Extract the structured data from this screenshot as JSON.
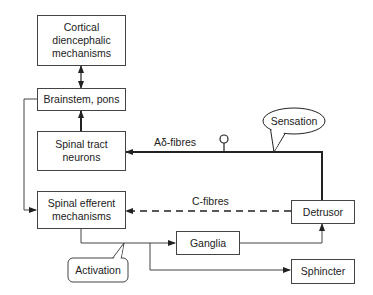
{
  "nodes": {
    "cortical": "Cortical diencephalic mechanisms",
    "cortical_lines": [
      "Cortical",
      "diencephalic",
      "mechanisms"
    ],
    "brainstem": "Brainstem, pons",
    "spinal_tract_lines": [
      "Spinal tract",
      "neurons"
    ],
    "spinal_efferent_lines": [
      "Spinal efferent",
      "mechanisms"
    ],
    "detrusor": "Detrusor",
    "ganglia": "Ganglia",
    "sphincter": "Sphincter"
  },
  "edges": {
    "a_delta": "Aδ-fibres",
    "c_fibres": "C-fibres"
  },
  "callouts": {
    "sensation": "Sensation",
    "activation": "Activation"
  },
  "colors": {
    "line": "#222222",
    "box_border": "#444444"
  }
}
